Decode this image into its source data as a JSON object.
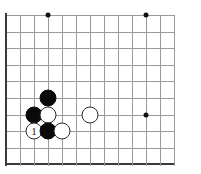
{
  "diagram": {
    "type": "go-board-diagram",
    "board": {
      "columns": 13,
      "rows": 10,
      "origin_x": 6,
      "origin_y": 15,
      "step_x": 14,
      "step_y": 16.6,
      "grid_color": "#9a9a9a",
      "edge_color": "#3a3a3a",
      "background_color": "#ffffff",
      "left_edge": true,
      "bottom_edge": true,
      "top_edge": false,
      "right_edge": false
    },
    "star_points": [
      {
        "col": 3,
        "row": 0
      },
      {
        "col": 10,
        "row": 0
      },
      {
        "col": 10,
        "row": 6
      }
    ],
    "stones": [
      {
        "color": "black",
        "col": 3,
        "row": 5,
        "label": ""
      },
      {
        "color": "black",
        "col": 2,
        "row": 6,
        "label": ""
      },
      {
        "color": "white",
        "col": 3,
        "row": 6,
        "label": ""
      },
      {
        "color": "white",
        "col": 6,
        "row": 6,
        "label": ""
      },
      {
        "color": "white",
        "col": 2,
        "row": 7,
        "label": "1"
      },
      {
        "color": "black",
        "col": 3,
        "row": 7,
        "label": ""
      },
      {
        "color": "white",
        "col": 4,
        "row": 7,
        "label": ""
      }
    ]
  }
}
